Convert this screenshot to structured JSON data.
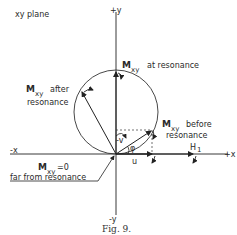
{
  "figure": {
    "plane_label": "xy plane",
    "caption": "Fig. 9.",
    "axes": {
      "plus_y": "+y",
      "minus_y": "-y",
      "plus_x": "+x",
      "minus_x": "-x"
    },
    "labels": {
      "at_resonance": {
        "M": "M",
        "sub": "xy",
        "text": "at resonance"
      },
      "after_resonance": {
        "M": "M",
        "sub": "xy",
        "text1": "after",
        "text2": "resonance"
      },
      "before_resonance": {
        "M": "M",
        "sub": "xy",
        "text1": "before",
        "text2": "resonance"
      },
      "far_from_resonance": {
        "M": "M",
        "sub": "xy",
        "eq": "=0",
        "text": "far from resonance"
      }
    },
    "components": {
      "u": "u",
      "v": "-v",
      "phi": "φ",
      "field": "H",
      "field_sub": "1"
    }
  }
}
